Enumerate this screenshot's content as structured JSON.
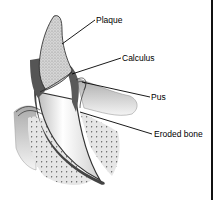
{
  "diagram": {
    "type": "anatomical-illustration",
    "labels": [
      {
        "id": "plaque",
        "text": "Plaque"
      },
      {
        "id": "calculus",
        "text": "Calculus"
      },
      {
        "id": "pus",
        "text": "Pus"
      },
      {
        "id": "eroded-bone",
        "text": "Eroded bone"
      }
    ]
  },
  "colors": {
    "background": "#ffffff",
    "ink": "#000000",
    "tooth_light": "#f2f2f2",
    "tooth_shade": "#8a8a8a",
    "calculus": "#5a5a5a",
    "gum": "#c8c8c8",
    "bone_dots": "#444444"
  }
}
